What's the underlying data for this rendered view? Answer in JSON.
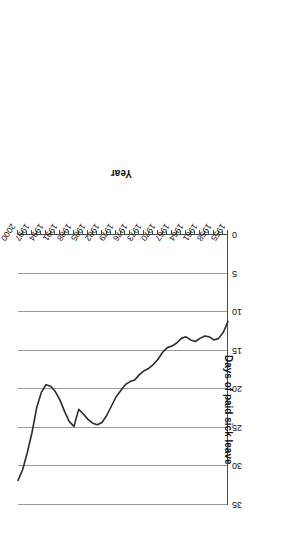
{
  "figure": {
    "rotation_degrees": 180,
    "background_color": "#ffffff",
    "line_color": "#2b2b2b",
    "gridline_color": "#9a9a9a",
    "axis_color": "#4a4a4a"
  },
  "chart_data": {
    "type": "line",
    "title": "",
    "xlabel": "Year",
    "ylabel": "Days of paid sick leave",
    "xlim": [
      1955,
      2000
    ],
    "ylim": [
      0,
      35
    ],
    "grid": "vertical-gridlines-at-value-ticks",
    "legend": "none",
    "ytick_labels": [
      "0",
      "5",
      "10",
      "15",
      "20",
      "25",
      "30",
      "35"
    ],
    "ytick_values": [
      0,
      5,
      10,
      15,
      20,
      25,
      30,
      35
    ],
    "xtick_labels": [
      "1955",
      "1958",
      "1961",
      "1964",
      "1967",
      "1970",
      "1973",
      "1976",
      "1979",
      "1982",
      "1985",
      "1988",
      "1991",
      "1994",
      "1997",
      "2000"
    ],
    "xtick_values": [
      1955,
      1958,
      1961,
      1964,
      1967,
      1970,
      1973,
      1976,
      1979,
      1982,
      1985,
      1988,
      1991,
      1994,
      1997,
      2000
    ],
    "xtick_minor_step": 1,
    "x": [
      1955,
      1956,
      1957,
      1958,
      1959,
      1960,
      1961,
      1962,
      1963,
      1964,
      1965,
      1966,
      1967,
      1968,
      1969,
      1970,
      1971,
      1972,
      1973,
      1974,
      1975,
      1976,
      1977,
      1978,
      1979,
      1980,
      1981,
      1982,
      1983,
      1984,
      1985,
      1986,
      1987,
      1988,
      1989,
      1990,
      1991,
      1992,
      1993,
      1994,
      1995,
      1996,
      1997,
      1998,
      1999,
      2000
    ],
    "values": [
      11.2,
      12.6,
      13.4,
      13.6,
      13.2,
      13.1,
      13.4,
      13.8,
      13.6,
      13.2,
      13.4,
      14.0,
      14.4,
      14.6,
      15.2,
      16.1,
      16.8,
      17.3,
      17.6,
      18.1,
      18.8,
      19.0,
      19.4,
      20.2,
      21.0,
      22.2,
      23.4,
      24.3,
      24.6,
      24.4,
      23.9,
      23.2,
      22.6,
      24.8,
      24.2,
      22.9,
      21.4,
      20.3,
      19.6,
      19.4,
      20.4,
      22.4,
      25.6,
      28.2,
      30.4,
      31.8
    ],
    "series": [
      {
        "name": "Days of paid sick leave",
        "values": [
          11.2,
          12.6,
          13.4,
          13.6,
          13.2,
          13.1,
          13.4,
          13.8,
          13.6,
          13.2,
          13.4,
          14.0,
          14.4,
          14.6,
          15.2,
          16.1,
          16.8,
          17.3,
          17.6,
          18.1,
          18.8,
          19.0,
          19.4,
          20.2,
          21.0,
          22.2,
          23.4,
          24.3,
          24.6,
          24.4,
          23.9,
          23.2,
          22.6,
          24.8,
          24.2,
          22.9,
          21.4,
          20.3,
          19.6,
          19.4,
          20.4,
          22.4,
          25.6,
          28.2,
          30.4,
          31.8
        ]
      }
    ]
  }
}
